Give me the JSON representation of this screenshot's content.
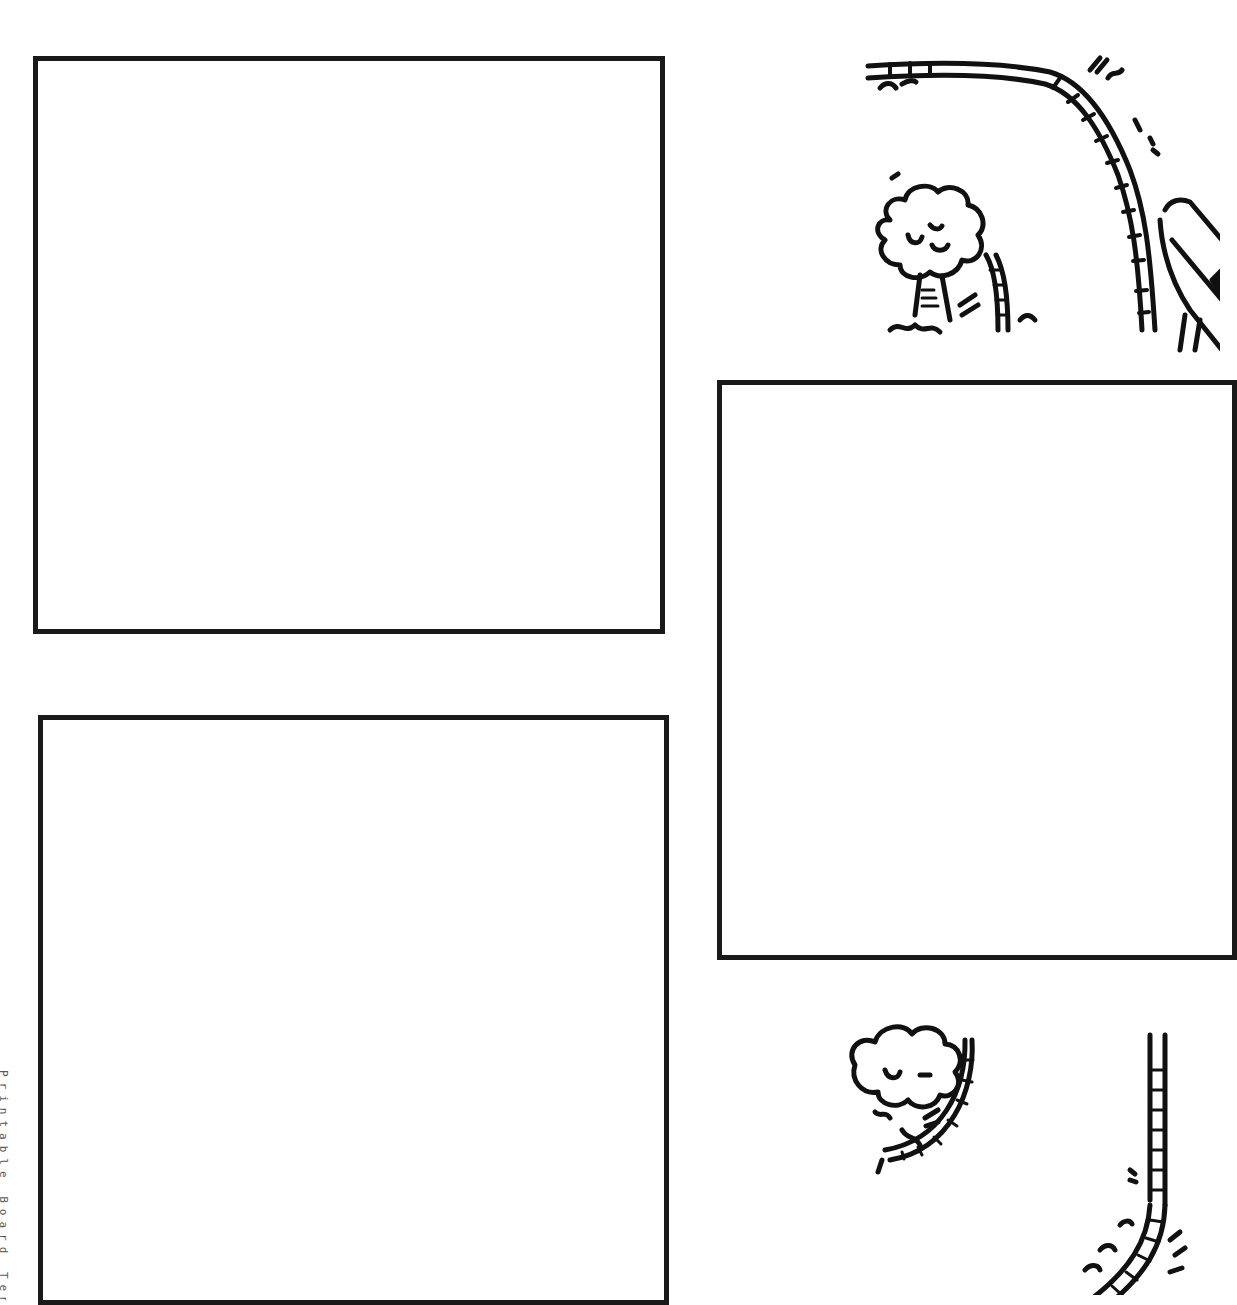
{
  "page": {
    "background": "#ffffff",
    "border_color": "#1a1a1a"
  },
  "panels": [
    {
      "id": "top-left",
      "label": ""
    },
    {
      "id": "right-middle",
      "label": ""
    },
    {
      "id": "bottom-left",
      "label": ""
    }
  ],
  "illustrations": [
    {
      "id": "top-right",
      "icon": "tree-and-curved-ladder-slide-icon"
    },
    {
      "id": "bottom-right",
      "icon": "tree-and-ladder-icon"
    }
  ],
  "credit": {
    "text": "Printable Board Template © 200"
  }
}
